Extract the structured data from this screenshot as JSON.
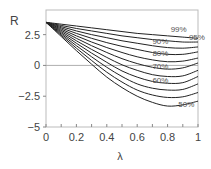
{
  "chart_data": {
    "type": "line",
    "title": "",
    "xlabel": "λ",
    "ylabel": "R",
    "xlim": [
      0,
      1
    ],
    "ylim": [
      -5,
      4.5
    ],
    "xticks": [
      "0",
      "0.2",
      "0.4",
      "0.6",
      "0.8",
      "1"
    ],
    "yticks": [
      "2.5",
      "0",
      "−2.5",
      "−5"
    ],
    "ytick_values": [
      2.5,
      0,
      -2.5,
      -5
    ],
    "grid": false,
    "reference_line_y": 0,
    "x": [
      0,
      0.1,
      0.2,
      0.3,
      0.4,
      0.5,
      0.6,
      0.7,
      0.8,
      0.9,
      1.0
    ],
    "series": [
      {
        "name": "99%",
        "label": "99%",
        "values": [
          3.5,
          3.35,
          3.2,
          3.05,
          2.9,
          2.75,
          2.6,
          2.5,
          2.4,
          2.3,
          2.2
        ]
      },
      {
        "name": "95%",
        "label": "95%",
        "values": [
          3.5,
          3.25,
          3.0,
          2.8,
          2.6,
          2.4,
          2.25,
          2.1,
          2.0,
          1.9,
          1.9
        ]
      },
      {
        "name": "90%",
        "label": "90%",
        "values": [
          3.5,
          3.15,
          2.8,
          2.5,
          2.25,
          2.0,
          1.8,
          1.6,
          1.45,
          1.4,
          1.5
        ]
      },
      {
        "name": "85%",
        "label": "",
        "values": [
          3.5,
          3.05,
          2.6,
          2.2,
          1.85,
          1.55,
          1.3,
          1.05,
          0.9,
          0.9,
          1.1
        ]
      },
      {
        "name": "80%",
        "label": "80%",
        "values": [
          3.5,
          2.95,
          2.4,
          1.9,
          1.45,
          1.05,
          0.7,
          0.45,
          0.3,
          0.35,
          0.6
        ]
      },
      {
        "name": "75%",
        "label": "",
        "values": [
          3.5,
          2.85,
          2.2,
          1.6,
          1.05,
          0.55,
          0.15,
          -0.15,
          -0.3,
          -0.2,
          0.2
        ]
      },
      {
        "name": "70%",
        "label": "70%",
        "values": [
          3.5,
          2.75,
          2.0,
          1.3,
          0.65,
          0.05,
          -0.4,
          -0.75,
          -0.9,
          -0.85,
          -0.4
        ]
      },
      {
        "name": "65%",
        "label": "",
        "values": [
          3.5,
          2.65,
          1.8,
          1.0,
          0.25,
          -0.45,
          -0.95,
          -1.3,
          -1.45,
          -1.4,
          -0.9
        ]
      },
      {
        "name": "60%",
        "label": "60%",
        "values": [
          3.5,
          2.55,
          1.6,
          0.7,
          -0.15,
          -0.9,
          -1.5,
          -1.85,
          -2.0,
          -1.95,
          -1.5
        ]
      },
      {
        "name": "55%",
        "label": "",
        "values": [
          3.5,
          2.45,
          1.4,
          0.4,
          -0.55,
          -1.35,
          -2.0,
          -2.4,
          -2.6,
          -2.55,
          -2.2
        ]
      },
      {
        "name": "50%",
        "label": "50%",
        "values": [
          3.5,
          2.35,
          1.2,
          0.1,
          -0.95,
          -1.8,
          -2.5,
          -3.0,
          -3.3,
          -3.2,
          -2.9
        ]
      }
    ],
    "label_positions": {
      "99%": [
        0.82,
        2.75
      ],
      "95%": [
        0.94,
        2.05
      ],
      "90%": [
        0.7,
        1.75
      ],
      "80%": [
        0.7,
        0.75
      ],
      "70%": [
        0.7,
        -0.3
      ],
      "60%": [
        0.7,
        -1.45
      ],
      "50%": [
        0.87,
        -3.35
      ]
    },
    "legend": "inline curve labels"
  }
}
